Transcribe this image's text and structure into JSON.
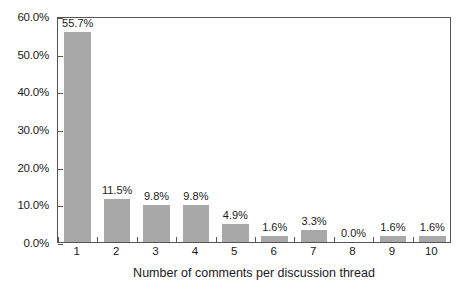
{
  "chart_data": {
    "type": "bar",
    "title": "",
    "xlabel": "Number of comments per discussion thread",
    "ylabel": "",
    "categories": [
      "1",
      "2",
      "3",
      "4",
      "5",
      "6",
      "7",
      "8",
      "9",
      "10"
    ],
    "values": [
      55.7,
      11.5,
      9.8,
      9.8,
      4.9,
      1.6,
      3.3,
      0.0,
      1.6,
      1.6
    ],
    "data_labels": [
      "55.7%",
      "11.5%",
      "9.8%",
      "9.8%",
      "4.9%",
      "1.6%",
      "3.3%",
      "0.0%",
      "1.6%",
      "1.6%"
    ],
    "ylim": [
      0,
      60
    ],
    "y_ticks": [
      0,
      10,
      20,
      30,
      40,
      50,
      60
    ],
    "y_tick_labels": [
      "0.0%",
      "10.0%",
      "20.0%",
      "30.0%",
      "40.0%",
      "50.0%",
      "60.0%"
    ],
    "grid": false,
    "legend": null,
    "bar_color": "#a8a8a8",
    "frame_color": "#555555",
    "background_color": "#ffffff"
  }
}
